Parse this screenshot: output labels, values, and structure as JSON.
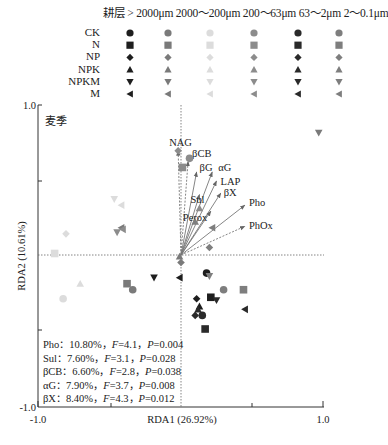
{
  "header": {
    "title": "耕层 > 2000μm 2000～200μm 200～63μm 63～2μm 2～0.1μm",
    "columns": [
      "耕层",
      ">2000μm",
      "2000～200μm",
      "200～63μm",
      "63～2μm",
      "2～0.1μm"
    ]
  },
  "legend": {
    "rows": [
      {
        "label": "CK",
        "shape": "circle"
      },
      {
        "label": "N",
        "shape": "square"
      },
      {
        "label": "NP",
        "shape": "diamond"
      },
      {
        "label": "NPK",
        "shape": "triangle-up"
      },
      {
        "label": "NPKM",
        "shape": "triangle-down"
      },
      {
        "label": "M",
        "shape": "triangle-left"
      }
    ],
    "column_colors": [
      "#1e1e1e",
      "#7a7a7a",
      "#dcdcdc",
      "#8c8c8c",
      "#2a2a2a",
      "#7e7e7e"
    ]
  },
  "panel_label": "麦季",
  "stats": [
    {
      "var": "Pho",
      "pct": "10.80%",
      "F": "4.1",
      "P": "0.004"
    },
    {
      "var": "Sul",
      "pct": "7.60%",
      "F": "3.1",
      "P": "0.028"
    },
    {
      "var": "βCB",
      "pct": "6.60%",
      "F": "2.8",
      "P": "0.038"
    },
    {
      "var": "αG",
      "pct": "7.90%",
      "F": "3.7",
      "P": "0.008"
    },
    {
      "var": "βX",
      "pct": "8.40%",
      "F": "4.3",
      "P": "0.012"
    }
  ],
  "chart_data": {
    "type": "scatter",
    "title": "麦季",
    "xlabel": "RDA1 (26.92%)",
    "ylabel": "RDA2 (10.61%)",
    "xlim": [
      -1.0,
      1.0
    ],
    "ylim": [
      -1.0,
      1.0
    ],
    "x_tick_labels": [
      "-1.0",
      "1.0"
    ],
    "y_tick_labels": [
      "1.0",
      "-1.0"
    ],
    "grid": false,
    "legend_position": "top",
    "zero_lines": "dotted",
    "vectors": [
      {
        "name": "NAG",
        "x": -0.02,
        "y": 0.69
      },
      {
        "name": "βCB",
        "x": 0.05,
        "y": 0.62
      },
      {
        "name": "βG",
        "x": 0.11,
        "y": 0.55
      },
      {
        "name": "αG",
        "x": 0.22,
        "y": 0.55
      },
      {
        "name": "LAP",
        "x": 0.25,
        "y": 0.49
      },
      {
        "name": "Sul",
        "x": 0.13,
        "y": 0.4
      },
      {
        "name": "βX",
        "x": 0.28,
        "y": 0.41
      },
      {
        "name": "Perox",
        "x": 0.21,
        "y": 0.29
      },
      {
        "name": "Pho",
        "x": 0.45,
        "y": 0.33
      },
      {
        "name": "PhOx",
        "x": 0.45,
        "y": 0.19
      }
    ],
    "series": [
      {
        "name": ">2000μm",
        "color": "#1e1e1e",
        "points": [
          {
            "treatment": "CK",
            "x": 0.18,
            "y": -0.12
          },
          {
            "treatment": "N",
            "x": 0.21,
            "y": -0.28
          },
          {
            "treatment": "NP",
            "x": 0.11,
            "y": -0.29
          },
          {
            "treatment": "NPK",
            "x": 0.13,
            "y": -0.34
          },
          {
            "treatment": "NPKM",
            "x": -0.19,
            "y": -0.15
          },
          {
            "treatment": "M",
            "x": -0.01,
            "y": -0.15
          }
        ]
      },
      {
        "name": "2000～200μm",
        "color": "#7a7a7a",
        "points": [
          {
            "treatment": "CK",
            "x": -0.34,
            "y": -0.23
          },
          {
            "treatment": "N",
            "x": -0.38,
            "y": -0.19
          },
          {
            "treatment": "NP",
            "x": 0.0,
            "y": -0.05
          },
          {
            "treatment": "NPK",
            "x": -0.01,
            "y": -0.01
          },
          {
            "treatment": "NPKM",
            "x": 0.97,
            "y": 0.81
          },
          {
            "treatment": "M",
            "x": -0.42,
            "y": 0.18
          }
        ]
      },
      {
        "name": "200～63μm",
        "color": "#dcdcdc",
        "points": [
          {
            "treatment": "CK",
            "x": -0.83,
            "y": -0.29
          },
          {
            "treatment": "N",
            "x": -0.89,
            "y": 0.01
          },
          {
            "treatment": "NP",
            "x": -0.81,
            "y": 0.14
          },
          {
            "treatment": "NPK",
            "x": -0.71,
            "y": -0.19
          },
          {
            "treatment": "NPKM",
            "x": -0.47,
            "y": 0.37
          },
          {
            "treatment": "M",
            "x": -0.42,
            "y": 0.33
          }
        ]
      },
      {
        "name": "63～2μm",
        "color": "#8c8c8c",
        "points": [
          {
            "treatment": "CK",
            "x": 0.06,
            "y": 0.64
          },
          {
            "treatment": "N",
            "x": 0.01,
            "y": 0.58
          },
          {
            "treatment": "NP",
            "x": -0.02,
            "y": 0.69
          },
          {
            "treatment": "NPK",
            "x": 0.13,
            "y": 0.31
          },
          {
            "treatment": "NPKM",
            "x": -0.45,
            "y": 0.15
          },
          {
            "treatment": "M",
            "x": -0.41,
            "y": 0.17
          }
        ]
      },
      {
        "name": "63～2μm (dark)",
        "color": "#2a2a2a",
        "points": [
          {
            "treatment": "CK",
            "x": 0.15,
            "y": -0.4
          },
          {
            "treatment": "N",
            "x": 0.17,
            "y": -0.49
          },
          {
            "treatment": "NP",
            "x": 0.1,
            "y": -0.4
          },
          {
            "treatment": "NPK",
            "x": 0.12,
            "y": -0.36
          },
          {
            "treatment": "NPKM",
            "x": 0.25,
            "y": -0.3
          },
          {
            "treatment": "M",
            "x": 0.45,
            "y": -0.36
          }
        ]
      },
      {
        "name": "2～0.1μm",
        "color": "#7e7e7e",
        "points": [
          {
            "treatment": "CK",
            "x": 0.3,
            "y": -0.23
          },
          {
            "treatment": "N",
            "x": 0.44,
            "y": -0.23
          },
          {
            "treatment": "NP",
            "x": 0.2,
            "y": 0.05
          },
          {
            "treatment": "NPK",
            "x": 0.1,
            "y": 0.22
          },
          {
            "treatment": "NPKM",
            "x": 0.2,
            "y": -0.14
          },
          {
            "treatment": "M",
            "x": 0.22,
            "y": 0.18
          }
        ]
      }
    ]
  }
}
